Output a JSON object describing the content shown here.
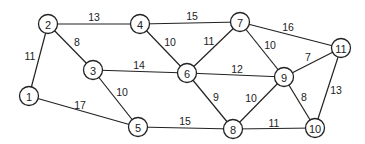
{
  "graph": {
    "nodes": [
      {
        "id": "1",
        "x": 29,
        "y": 96
      },
      {
        "id": "2",
        "x": 48,
        "y": 24
      },
      {
        "id": "3",
        "x": 93,
        "y": 70
      },
      {
        "id": "4",
        "x": 140,
        "y": 24
      },
      {
        "id": "5",
        "x": 138,
        "y": 127
      },
      {
        "id": "6",
        "x": 187,
        "y": 73
      },
      {
        "id": "7",
        "x": 240,
        "y": 22
      },
      {
        "id": "8",
        "x": 233,
        "y": 129
      },
      {
        "id": "9",
        "x": 284,
        "y": 77
      },
      {
        "id": "10",
        "x": 315,
        "y": 128
      },
      {
        "id": "11",
        "x": 341,
        "y": 48
      }
    ],
    "edges": [
      {
        "from": "1",
        "to": "2",
        "weight": "11",
        "lx": 30,
        "ly": 56
      },
      {
        "from": "1",
        "to": "5",
        "weight": "17",
        "lx": 80,
        "ly": 105
      },
      {
        "from": "2",
        "to": "4",
        "weight": "13",
        "lx": 94,
        "ly": 17
      },
      {
        "from": "2",
        "to": "3",
        "weight": "8",
        "lx": 77,
        "ly": 42
      },
      {
        "from": "3",
        "to": "6",
        "weight": "14",
        "lx": 139,
        "ly": 65
      },
      {
        "from": "3",
        "to": "5",
        "weight": "10",
        "lx": 122,
        "ly": 92
      },
      {
        "from": "4",
        "to": "7",
        "weight": "15",
        "lx": 192,
        "ly": 16
      },
      {
        "from": "4",
        "to": "6",
        "weight": "10",
        "lx": 170,
        "ly": 42
      },
      {
        "from": "5",
        "to": "8",
        "weight": "15",
        "lx": 185,
        "ly": 121
      },
      {
        "from": "6",
        "to": "7",
        "weight": "11",
        "lx": 209,
        "ly": 41
      },
      {
        "from": "6",
        "to": "9",
        "weight": "12",
        "lx": 237,
        "ly": 69
      },
      {
        "from": "6",
        "to": "8",
        "weight": "9",
        "lx": 216,
        "ly": 97
      },
      {
        "from": "7",
        "to": "9",
        "weight": "10",
        "lx": 270,
        "ly": 45
      },
      {
        "from": "7",
        "to": "11",
        "weight": "16",
        "lx": 288,
        "ly": 27
      },
      {
        "from": "9",
        "to": "11",
        "weight": "7",
        "lx": 308,
        "ly": 57
      },
      {
        "from": "9",
        "to": "8",
        "weight": "10",
        "lx": 251,
        "ly": 98
      },
      {
        "from": "9",
        "to": "10",
        "weight": "8",
        "lx": 304,
        "ly": 97
      },
      {
        "from": "8",
        "to": "10",
        "weight": "11",
        "lx": 274,
        "ly": 123
      },
      {
        "from": "11",
        "to": "10",
        "weight": "13",
        "lx": 336,
        "ly": 90
      }
    ]
  }
}
